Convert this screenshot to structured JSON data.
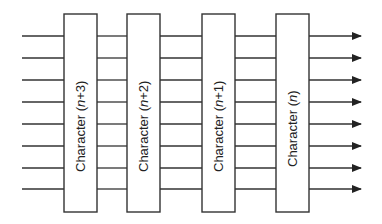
{
  "diagram": {
    "title": "",
    "wire_count": 8,
    "wire_y": [
      36,
      58,
      80,
      102,
      124,
      146,
      168,
      189
    ],
    "colors": {
      "line": "#333333",
      "box_fill": "#ffffff",
      "text": "#222222"
    },
    "boxes": [
      {
        "label_prefix": "Character (",
        "label_var": "n",
        "label_suffix": "+3)",
        "x": 64,
        "width": 33
      },
      {
        "label_prefix": "Character (",
        "label_var": "n",
        "label_suffix": "+2)",
        "x": 127,
        "width": 33
      },
      {
        "label_prefix": "Character (",
        "label_var": "n",
        "label_suffix": "+1)",
        "x": 202,
        "width": 33
      },
      {
        "label_prefix": "Character (",
        "label_var": "n",
        "label_suffix": ")",
        "x": 276,
        "width": 33
      }
    ],
    "output_arrows": "right-pointing filled arrowheads on each wire"
  }
}
